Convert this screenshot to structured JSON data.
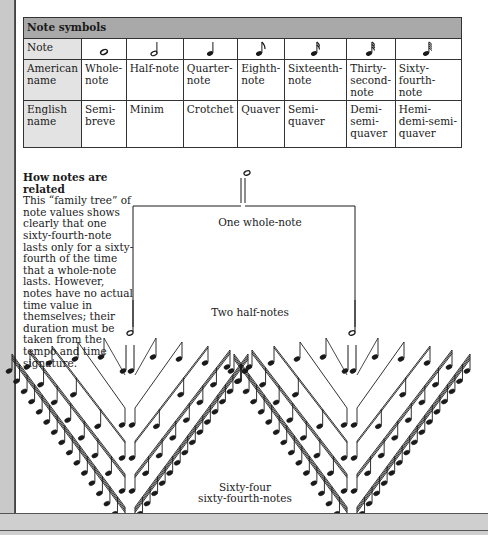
{
  "table": {
    "title": "Note symbols",
    "row_headers": [
      "Note",
      "American name",
      "English name"
    ],
    "columns": [
      {
        "symbol": "whole-note-icon",
        "american": "Whole-note",
        "english": "Semi-breve"
      },
      {
        "symbol": "half-note-icon",
        "american": "Half-note",
        "english": "Minim"
      },
      {
        "symbol": "quarter-note-icon",
        "american": "Quarter-note",
        "english": "Crotchet"
      },
      {
        "symbol": "eighth-note-icon",
        "american": "Eighth-note",
        "english": "Quaver"
      },
      {
        "symbol": "sixteenth-note-icon",
        "american": "Sixteenth-note",
        "english": "Semi-quaver"
      },
      {
        "symbol": "thirty-second-note-icon",
        "american": "Thirty-second-note",
        "english": "Demi-semi-quaver"
      },
      {
        "symbol": "sixty-fourth-note-icon",
        "american": "Sixty-fourth-note",
        "english": "Hemi-demi-semi-quaver"
      }
    ],
    "american_display": [
      "Whole-\nnote",
      "Half-note",
      "Quarter-\nnote",
      "Eighth-\nnote",
      "Sixteenth-\nnote",
      "Thirty-\nsecond-\nnote",
      "Sixty-\nfourth-\nnote"
    ],
    "english_display": [
      "Semi-\nbreve",
      "Minim",
      "Crotchet",
      "Quaver",
      "Semi-\nquaver",
      "Demi-\nsemi-\nquaver",
      "Hemi-\ndemi-semi-\nquaver"
    ]
  },
  "caption": {
    "title": "How notes are related",
    "body": "This “family tree” of note values shows clearly that one sixty-fourth-note lasts only for a sixty-fourth of the time that a whole-note lasts. However, notes have no actual time value in themselves; their duration must be taken from the tempo and time signature."
  },
  "tree": {
    "label_whole": "One whole-note",
    "label_half": "Two half-notes",
    "label_bottom_line1": "Sixty-four",
    "label_bottom_line2": "sixty-fourth-notes"
  },
  "colors": {
    "table_title_bg": "#a9a9a9",
    "row_header_bg": "#e3e3e3",
    "frame_gray": "#c9c9c9",
    "ink": "#1a1a1a"
  }
}
